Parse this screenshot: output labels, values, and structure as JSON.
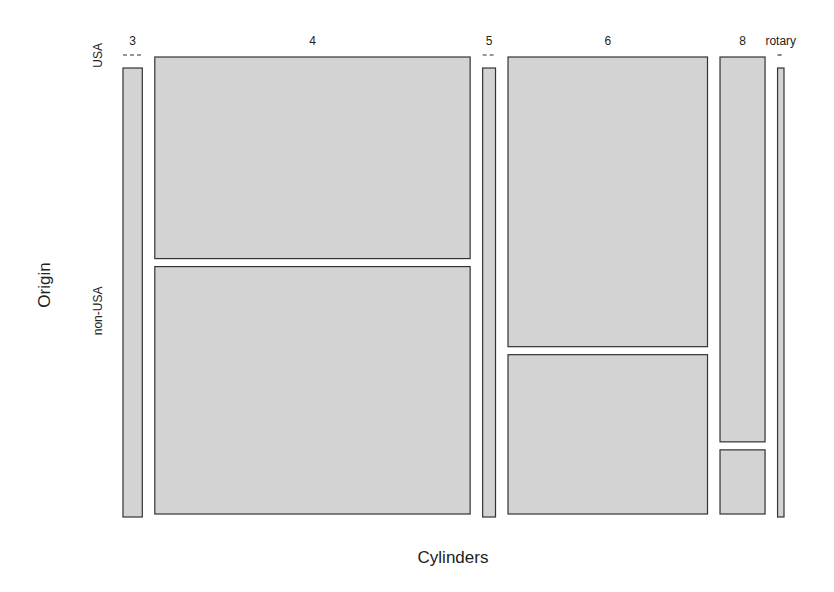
{
  "chart_data": {
    "type": "mosaic",
    "title": "",
    "xlabel": "Cylinders",
    "ylabel": "Origin",
    "x_categories": [
      "3",
      "4",
      "5",
      "6",
      "8",
      "rotary"
    ],
    "y_categories": [
      "USA",
      "non-USA"
    ],
    "counts": [
      {
        "cylinders": "3",
        "USA": 0,
        "non-USA": 3
      },
      {
        "cylinders": "4",
        "USA": 22,
        "non-USA": 27
      },
      {
        "cylinders": "5",
        "USA": 0,
        "non-USA": 2
      },
      {
        "cylinders": "6",
        "USA": 20,
        "non-USA": 11
      },
      {
        "cylinders": "8",
        "USA": 6,
        "non-USA": 1
      },
      {
        "cylinders": "rotary",
        "USA": 0,
        "non-USA": 1
      }
    ],
    "fill_color": "#d3d3d3",
    "border_color": "#333333"
  }
}
